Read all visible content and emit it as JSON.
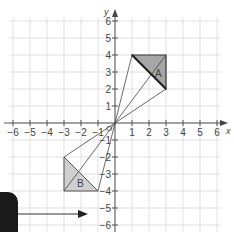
{
  "figure": {
    "x_axis_label": "x",
    "y_axis_label": "y",
    "origin_label": "O",
    "x_ticks": [
      "−6",
      "−5",
      "−4",
      "−3",
      "−2",
      "−1",
      "1",
      "2",
      "3",
      "4",
      "5",
      "6"
    ],
    "y_ticks": [
      "6",
      "5",
      "4",
      "3",
      "2",
      "1",
      "−1",
      "−2",
      "−3",
      "−4",
      "−5",
      "−6"
    ],
    "shape_a": {
      "label": "A",
      "vertices": [
        [
          1,
          4
        ],
        [
          3,
          4
        ],
        [
          3,
          2
        ]
      ],
      "fill": "#a6a6a6"
    },
    "shape_b": {
      "label": "B",
      "vertices": [
        [
          -3,
          -2
        ],
        [
          -3,
          -4
        ],
        [
          -1,
          -4
        ]
      ],
      "fill": "#cfcfcf"
    },
    "grid_color": "#d9d9d9",
    "axis_color": "#555555",
    "line_color": "#444444"
  },
  "overlay": {
    "panel_color": "#1a1a1a",
    "arrow_direction": "right"
  }
}
